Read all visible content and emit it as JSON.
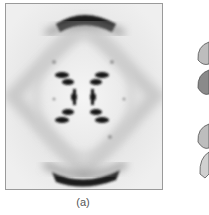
{
  "figure": {
    "caption": "(a)",
    "colors": {
      "background": "#ececec",
      "spots": "#1a1a1a",
      "border": "#9a9a9a"
    }
  },
  "side_panel": {
    "subject": "partial-helix-illustration"
  }
}
